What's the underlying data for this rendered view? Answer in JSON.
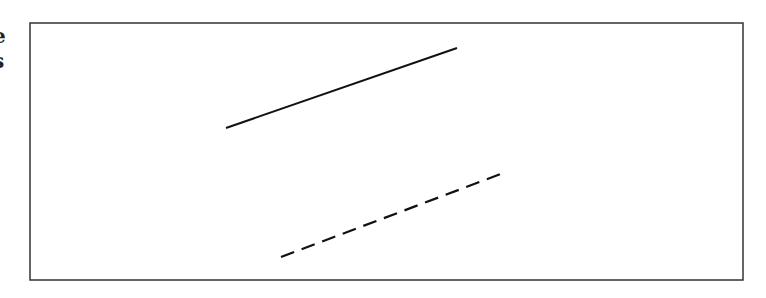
{
  "canvas": {
    "width": 766,
    "height": 298,
    "background": "#ffffff"
  },
  "edge_fragments": {
    "note": "partially cropped glyphs at the left image edge",
    "first": "e",
    "second": "s"
  },
  "frame": {
    "x": 30,
    "y": 23,
    "width": 713,
    "height": 257,
    "stroke": "#333333",
    "stroke_width": 1.5
  },
  "lines": [
    {
      "id": "solid-line",
      "style": "solid",
      "x1": 226,
      "y1": 128,
      "x2": 457,
      "y2": 48,
      "stroke": "#111111",
      "stroke_width": 2
    },
    {
      "id": "dashed-line",
      "style": "dashed",
      "x1": 281,
      "y1": 257,
      "x2": 506,
      "y2": 172,
      "stroke": "#111111",
      "stroke_width": 2.2,
      "dasharray": "14 8"
    }
  ]
}
